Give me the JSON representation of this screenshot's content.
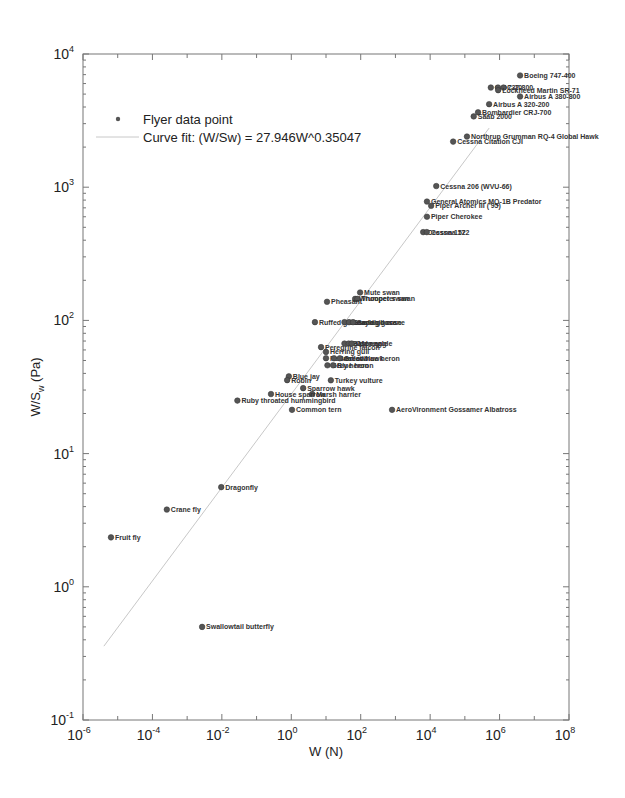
{
  "chart_data": {
    "type": "scatter",
    "title": "",
    "xlabel": "W (N)",
    "ylabel": "W/S_w (Pa)",
    "xscale": "log",
    "yscale": "log",
    "xlim": [
      1e-06,
      100000000.0
    ],
    "ylim": [
      0.1,
      10000
    ],
    "grid": false,
    "x_tick_labels": [
      "10^-6",
      "10^-4",
      "10^-2",
      "10^0",
      "10^2",
      "10^4",
      "10^6",
      "10^8"
    ],
    "y_tick_labels": [
      "10^-1",
      "10^0",
      "10^1",
      "10^2",
      "10^3",
      "10^4"
    ],
    "legend": {
      "position": "upper-left",
      "entries": [
        "Flyer data point",
        "Curve fit:  (W/Sw) = 27.946W^0.35047"
      ]
    },
    "fit": {
      "a": 27.946,
      "b": 0.35047,
      "x_range": [
        4e-06,
        500000.0
      ],
      "color": "#c8c8c8"
    },
    "series": [
      {
        "name": "Flyer data point",
        "color": "#555555",
        "points": [
          {
            "label": "Boeing 747-400",
            "W": 3900000,
            "WS": 6900
          },
          {
            "label": "C-5",
            "W": 560000,
            "WS": 5600
          },
          {
            "label": "DC-10",
            "W": 900000,
            "WS": 5600
          },
          {
            "label": "737-800",
            "W": 1300000,
            "WS": 5600
          },
          {
            "label": "Lockheed Martin SR-71",
            "W": 910000,
            "WS": 5350
          },
          {
            "label": "Airbus A 380-800",
            "W": 3900000,
            "WS": 4800
          },
          {
            "label": "Airbus A 320-200",
            "W": 500000,
            "WS": 4200
          },
          {
            "label": "Bombardier CRJ-700",
            "W": 240000,
            "WS": 3650
          },
          {
            "label": "Saab 2000",
            "W": 180000,
            "WS": 3400
          },
          {
            "label": "Northrup Grumman RQ-4 Global Hawk",
            "W": 115000,
            "WS": 2400
          },
          {
            "label": "Cessna Citation CJI",
            "W": 46000,
            "WS": 2200
          },
          {
            "label": "Cessna 206 (WVU-66)",
            "W": 15000,
            "WS": 1020
          },
          {
            "label": "General Atomics MQ-1B Predator",
            "W": 8100,
            "WS": 780
          },
          {
            "label": "Piper Archer III ('95)",
            "W": 10700,
            "WS": 725
          },
          {
            "label": "Piper Cherokee",
            "W": 8100,
            "WS": 600
          },
          {
            "label": "Cessna 152",
            "W": 6300,
            "WS": 460
          },
          {
            "label": "Cessna 172",
            "W": 8000,
            "WS": 460
          },
          {
            "label": "Mute swan",
            "W": 96,
            "WS": 162
          },
          {
            "label": "Whooper swan",
            "W": 69,
            "WS": 145
          },
          {
            "label": "Trumpeter swan",
            "W": 80,
            "WS": 145
          },
          {
            "label": "Pheasant",
            "W": 10.7,
            "WS": 138
          },
          {
            "label": "Ruffed grouse",
            "W": 4.8,
            "WS": 97
          },
          {
            "label": "Canada goose",
            "W": 34,
            "WS": 97
          },
          {
            "label": "Graylag goose",
            "W": 46,
            "WS": 97
          },
          {
            "label": "Sandhill crane",
            "W": 60,
            "WS": 97
          },
          {
            "label": "Golden eagle",
            "W": 34,
            "WS": 67
          },
          {
            "label": "Bald eagle",
            "W": 45,
            "WS": 67
          },
          {
            "label": "Osprey",
            "W": 55,
            "WS": 67
          },
          {
            "label": "Peregrine falcon",
            "W": 7.2,
            "WS": 63
          },
          {
            "label": "Herring gull",
            "W": 10,
            "WS": 58
          },
          {
            "label": "Red-tailed hawk",
            "W": 10,
            "WS": 52
          },
          {
            "label": "Barn owl",
            "W": 17,
            "WS": 52
          },
          {
            "label": "Great blue heron",
            "W": 25,
            "WS": 52
          },
          {
            "label": "Grey heron",
            "W": 11,
            "WS": 46
          },
          {
            "label": "Blue heron",
            "W": 16,
            "WS": 46
          },
          {
            "label": "Blue jay",
            "W": 0.85,
            "WS": 38
          },
          {
            "label": "Robin",
            "W": 0.76,
            "WS": 35.6
          },
          {
            "label": "Turkey vulture",
            "W": 13.8,
            "WS": 35.5
          },
          {
            "label": "Sparrow hawk",
            "W": 2.2,
            "WS": 31
          },
          {
            "label": "Marsh harrier",
            "W": 4.0,
            "WS": 28
          },
          {
            "label": "House sparrow",
            "W": 0.26,
            "WS": 28
          },
          {
            "label": "Ruby throated hummingbird",
            "W": 0.028,
            "WS": 25
          },
          {
            "label": "Common tern",
            "W": 1.05,
            "WS": 21.3
          },
          {
            "label": "AeroVironment Gossamer Albatross",
            "W": 800,
            "WS": 21.3
          },
          {
            "label": "Dragonfly",
            "W": 0.0096,
            "WS": 5.6
          },
          {
            "label": "Crane fly",
            "W": 0.00026,
            "WS": 3.8
          },
          {
            "label": "Fruit fly",
            "W": 6.4e-06,
            "WS": 2.35
          },
          {
            "label": "Swallowtail butterfly",
            "W": 0.0027,
            "WS": 0.5
          }
        ]
      }
    ]
  },
  "axes": {
    "xlabel_main": "W (N)",
    "ylabel_main": "W/S",
    "ylabel_sub": "w",
    "ylabel_unit": " (Pa)"
  },
  "legend": {
    "marker_label": "Flyer data point",
    "fit_label": "Curve fit:  (W/Sw) = 27.946W^0.35047"
  },
  "colors": {
    "axis": "#777777",
    "marker": "#555555",
    "fit": "#c8c8c8"
  }
}
